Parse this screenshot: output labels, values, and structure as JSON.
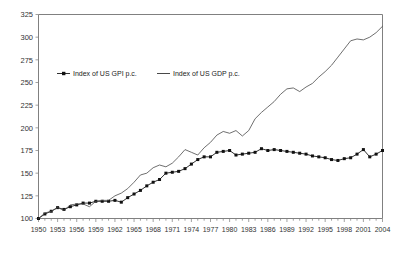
{
  "chart_data": {
    "type": "line",
    "title": "",
    "subtitle": "",
    "xlabel": "",
    "ylabel": "",
    "grid": false,
    "legend_position": "inside-upper-left",
    "ylim": [
      100,
      325
    ],
    "yticks": [
      100,
      125,
      150,
      175,
      200,
      225,
      250,
      275,
      300,
      325
    ],
    "ytick_labels": [
      "100",
      "125",
      "150",
      "175",
      "200",
      "225",
      "250",
      "275",
      "300",
      "325"
    ],
    "xlim": [
      1950,
      2004
    ],
    "xticks": [
      1950,
      1953,
      1956,
      1959,
      1962,
      1965,
      1968,
      1971,
      1974,
      1977,
      1980,
      1983,
      1986,
      1989,
      1992,
      1995,
      1998,
      2001,
      2004
    ],
    "xtick_labels": [
      "1950",
      "1953",
      "1956",
      "1959",
      "1962",
      "1965",
      "1968",
      "1971",
      "1974",
      "1977",
      "1980",
      "1983",
      "1986",
      "1989",
      "1992",
      "1995",
      "1998",
      "2001",
      "2004"
    ],
    "x": [
      1950,
      1951,
      1952,
      1953,
      1954,
      1955,
      1956,
      1957,
      1958,
      1959,
      1960,
      1961,
      1962,
      1963,
      1964,
      1965,
      1966,
      1967,
      1968,
      1969,
      1970,
      1971,
      1972,
      1973,
      1974,
      1975,
      1976,
      1977,
      1978,
      1979,
      1980,
      1981,
      1982,
      1983,
      1984,
      1985,
      1986,
      1987,
      1988,
      1989,
      1990,
      1991,
      1992,
      1993,
      1994,
      1995,
      1996,
      1997,
      1998,
      1999,
      2000,
      2001,
      2002,
      2003,
      2004
    ],
    "series": [
      {
        "name": "Index of US GPI p.c.",
        "marker": "filled-square",
        "line_style": "solid-with-markers",
        "values": [
          100,
          105,
          108,
          112,
          110,
          113,
          115,
          117,
          117,
          119,
          119,
          119,
          120,
          118,
          123,
          127,
          131,
          136,
          140,
          143,
          150,
          151,
          152,
          155,
          160,
          165,
          168,
          168,
          173,
          174,
          175,
          170,
          171,
          172,
          173,
          177,
          175,
          176,
          175,
          174,
          173,
          172,
          171,
          169,
          168,
          167,
          165,
          164,
          166,
          167,
          171,
          176,
          168,
          171,
          175
        ]
      },
      {
        "name": "Index of US GDP p.c.",
        "marker": "none",
        "line_style": "solid",
        "values": [
          100,
          106,
          108,
          112,
          109,
          115,
          116,
          116,
          113,
          119,
          120,
          120,
          125,
          128,
          133,
          140,
          148,
          150,
          156,
          159,
          157,
          161,
          168,
          176,
          173,
          170,
          178,
          184,
          192,
          196,
          194,
          197,
          191,
          197,
          210,
          217,
          223,
          229,
          237,
          243,
          244,
          240,
          245,
          249,
          256,
          262,
          269,
          278,
          287,
          296,
          298,
          297,
          300,
          305,
          312
        ]
      }
    ],
    "annotations": []
  },
  "legend": {
    "entries": [
      {
        "label": "Index of US GPI p.c.",
        "marker": "filled-square-with-line"
      },
      {
        "label": "Index of US GDP p.c.",
        "marker": "plain-line"
      }
    ]
  }
}
